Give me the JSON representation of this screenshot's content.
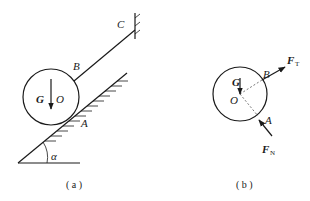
{
  "figure_a": {
    "caption": "( a )",
    "labels": {
      "C": "C",
      "B": "B",
      "G": "G",
      "O": "O",
      "A": "A",
      "alpha": "α"
    }
  },
  "figure_b": {
    "caption": "( b )",
    "labels": {
      "G": "G",
      "O": "O",
      "B": "B",
      "A": "A",
      "FT_main": "F",
      "FT_sub": "T",
      "FN_main": "F",
      "FN_sub": "N"
    }
  },
  "colors": {
    "stroke": "#1a1a1a",
    "background": "#ffffff"
  }
}
